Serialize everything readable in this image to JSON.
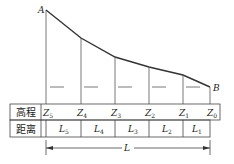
{
  "diagram": {
    "points": {
      "start": "A",
      "end": "B"
    },
    "table": {
      "row_elevation_label": "高程",
      "row_distance_label": "距离",
      "elevations": [
        {
          "base": "Z",
          "sub": "5"
        },
        {
          "base": "Z",
          "sub": "4"
        },
        {
          "base": "Z",
          "sub": "3"
        },
        {
          "base": "Z",
          "sub": "2"
        },
        {
          "base": "Z",
          "sub": "1"
        },
        {
          "base": "Z",
          "sub": "0"
        }
      ],
      "distances": [
        {
          "base": "L",
          "sub": "5"
        },
        {
          "base": "L",
          "sub": "4"
        },
        {
          "base": "L",
          "sub": "3"
        },
        {
          "base": "L",
          "sub": "2"
        },
        {
          "base": "L",
          "sub": "1"
        }
      ]
    },
    "total_length_label": "L",
    "colors": {
      "line": "#333333",
      "thin": "#555555"
    }
  }
}
